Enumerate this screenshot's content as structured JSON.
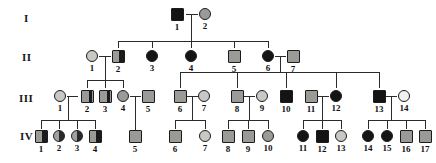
{
  "figure": {
    "background_color": "#ffffff",
    "line_color": "#2b2b2b"
  },
  "legend_colors": {
    "affected_black": "#141414",
    "carrier_gray": "#9a9a96",
    "light_gray": "#c9c8c4",
    "unaffected_clear": "#f2f1ee"
  },
  "generation_labels": [
    {
      "id": "gen-I",
      "text": "I",
      "x": 24,
      "y": 12
    },
    {
      "id": "gen-II",
      "text": "II",
      "x": 22,
      "y": 51
    },
    {
      "id": "gen-III",
      "text": "III",
      "x": 19,
      "y": 92
    },
    {
      "id": "gen-IV",
      "text": "IV",
      "x": 20,
      "y": 130
    }
  ],
  "individuals": [
    {
      "gen": "I",
      "num": "1",
      "sex": "male",
      "fill": "black",
      "cx": 177,
      "cy": 14
    },
    {
      "gen": "I",
      "num": "2",
      "sex": "female",
      "fill": "gray",
      "cx": 205,
      "cy": 14
    },
    {
      "gen": "II",
      "num": "1",
      "sex": "female",
      "fill": "lgray",
      "cx": 92,
      "cy": 56
    },
    {
      "gen": "II",
      "num": "2",
      "sex": "male",
      "fill": "halfright",
      "cx": 118,
      "cy": 56
    },
    {
      "gen": "II",
      "num": "3",
      "sex": "female",
      "fill": "black",
      "cx": 152,
      "cy": 56
    },
    {
      "gen": "II",
      "num": "4",
      "sex": "female",
      "fill": "black",
      "cx": 191,
      "cy": 56
    },
    {
      "gen": "II",
      "num": "5",
      "sex": "male",
      "fill": "gray",
      "cx": 234,
      "cy": 56
    },
    {
      "gen": "II",
      "num": "6",
      "sex": "female",
      "fill": "black",
      "cx": 268,
      "cy": 56
    },
    {
      "gen": "II",
      "num": "7",
      "sex": "male",
      "fill": "gray",
      "cx": 293,
      "cy": 56
    },
    {
      "gen": "III",
      "num": "1",
      "sex": "female",
      "fill": "lgray",
      "cx": 60,
      "cy": 96
    },
    {
      "gen": "III",
      "num": "2",
      "sex": "male",
      "fill": "bandright",
      "cx": 87,
      "cy": 96
    },
    {
      "gen": "III",
      "num": "3",
      "sex": "male",
      "fill": "bandright",
      "cx": 105,
      "cy": 96
    },
    {
      "gen": "III",
      "num": "4",
      "sex": "female",
      "fill": "gray",
      "cx": 123,
      "cy": 96
    },
    {
      "gen": "III",
      "num": "5",
      "sex": "male",
      "fill": "gray",
      "cx": 148,
      "cy": 96
    },
    {
      "gen": "III",
      "num": "6",
      "sex": "male",
      "fill": "gray",
      "cx": 180,
      "cy": 96
    },
    {
      "gen": "III",
      "num": "7",
      "sex": "female",
      "fill": "lgray",
      "cx": 204,
      "cy": 96
    },
    {
      "gen": "III",
      "num": "8",
      "sex": "male",
      "fill": "gray",
      "cx": 237,
      "cy": 96
    },
    {
      "gen": "III",
      "num": "9",
      "sex": "female",
      "fill": "lgray",
      "cx": 262,
      "cy": 96
    },
    {
      "gen": "III",
      "num": "10",
      "sex": "male",
      "fill": "black",
      "cx": 286,
      "cy": 96
    },
    {
      "gen": "III",
      "num": "11",
      "sex": "male",
      "fill": "gray",
      "cx": 311,
      "cy": 96
    },
    {
      "gen": "III",
      "num": "12",
      "sex": "female",
      "fill": "black",
      "cx": 336,
      "cy": 96
    },
    {
      "gen": "III",
      "num": "13",
      "sex": "male",
      "fill": "black",
      "cx": 379,
      "cy": 96
    },
    {
      "gen": "III",
      "num": "14",
      "sex": "female",
      "fill": "clear",
      "cx": 404,
      "cy": 96
    },
    {
      "gen": "IV",
      "num": "1",
      "sex": "male",
      "fill": "halfright",
      "cx": 41,
      "cy": 136
    },
    {
      "gen": "IV",
      "num": "2",
      "sex": "female",
      "fill": "halfright-c",
      "cx": 59,
      "cy": 136
    },
    {
      "gen": "IV",
      "num": "3",
      "sex": "female",
      "fill": "halfright-c",
      "cx": 77,
      "cy": 136
    },
    {
      "gen": "IV",
      "num": "4",
      "sex": "male",
      "fill": "halfright",
      "cx": 95,
      "cy": 136
    },
    {
      "gen": "IV",
      "num": "5",
      "sex": "male",
      "fill": "gray",
      "cx": 135,
      "cy": 136
    },
    {
      "gen": "IV",
      "num": "6",
      "sex": "male",
      "fill": "gray",
      "cx": 175,
      "cy": 136
    },
    {
      "gen": "IV",
      "num": "7",
      "sex": "female",
      "fill": "lgray",
      "cx": 205,
      "cy": 136
    },
    {
      "gen": "IV",
      "num": "8",
      "sex": "male",
      "fill": "gray",
      "cx": 228,
      "cy": 136
    },
    {
      "gen": "IV",
      "num": "9",
      "sex": "male",
      "fill": "gray",
      "cx": 248,
      "cy": 136
    },
    {
      "gen": "IV",
      "num": "10",
      "sex": "female",
      "fill": "gray",
      "cx": 268,
      "cy": 136
    },
    {
      "gen": "IV",
      "num": "11",
      "sex": "female",
      "fill": "black",
      "cx": 303,
      "cy": 136
    },
    {
      "gen": "IV",
      "num": "12",
      "sex": "male",
      "fill": "black",
      "cx": 322,
      "cy": 136
    },
    {
      "gen": "IV",
      "num": "13",
      "sex": "female",
      "fill": "lgray",
      "cx": 341,
      "cy": 136
    },
    {
      "gen": "IV",
      "num": "14",
      "sex": "female",
      "fill": "black",
      "cx": 368,
      "cy": 136
    },
    {
      "gen": "IV",
      "num": "15",
      "sex": "female",
      "fill": "black",
      "cx": 387,
      "cy": 136
    },
    {
      "gen": "IV",
      "num": "16",
      "sex": "male",
      "fill": "gray",
      "cx": 406,
      "cy": 136
    },
    {
      "gen": "IV",
      "num": "17",
      "sex": "male",
      "fill": "gray",
      "cx": 425,
      "cy": 136
    }
  ],
  "connectors": [
    {
      "name": "mating-I1-I2",
      "orient": "h",
      "x": 186,
      "y": 14,
      "len": 12
    },
    {
      "name": "descent-I-to-II",
      "orient": "v",
      "x": 191,
      "y": 14,
      "len": 27
    },
    {
      "name": "sibship-II-bar",
      "orient": "h",
      "x": 118,
      "y": 41,
      "len": 150
    },
    {
      "name": "drop-II-2",
      "orient": "v",
      "x": 118,
      "y": 41,
      "len": 7
    },
    {
      "name": "drop-II-3",
      "orient": "v",
      "x": 152,
      "y": 41,
      "len": 7
    },
    {
      "name": "drop-II-4",
      "orient": "v",
      "x": 191,
      "y": 41,
      "len": 7
    },
    {
      "name": "drop-II-5",
      "orient": "v",
      "x": 234,
      "y": 41,
      "len": 7
    },
    {
      "name": "drop-II-6",
      "orient": "v",
      "x": 268,
      "y": 41,
      "len": 7
    },
    {
      "name": "mating-II1-II2",
      "orient": "h",
      "x": 99,
      "y": 56,
      "len": 12
    },
    {
      "name": "descent-II1x2",
      "orient": "v",
      "x": 105,
      "y": 56,
      "len": 24
    },
    {
      "name": "sibship-III-A",
      "orient": "h",
      "x": 87,
      "y": 80,
      "len": 36
    },
    {
      "name": "drop-III-2",
      "orient": "v",
      "x": 87,
      "y": 80,
      "len": 8
    },
    {
      "name": "drop-III-3",
      "orient": "v",
      "x": 105,
      "y": 80,
      "len": 8
    },
    {
      "name": "drop-III-4",
      "orient": "v",
      "x": 123,
      "y": 80,
      "len": 8
    },
    {
      "name": "mating-II6-II7",
      "orient": "h",
      "x": 275,
      "y": 56,
      "len": 11
    },
    {
      "name": "descent-II6x7",
      "orient": "v",
      "x": 280,
      "y": 56,
      "len": 16
    },
    {
      "name": "sibship-III-B",
      "orient": "h",
      "x": 180,
      "y": 72,
      "len": 199
    },
    {
      "name": "drop-III-6",
      "orient": "v",
      "x": 180,
      "y": 72,
      "len": 16
    },
    {
      "name": "drop-III-8",
      "orient": "v",
      "x": 237,
      "y": 72,
      "len": 16
    },
    {
      "name": "drop-III-10",
      "orient": "v",
      "x": 286,
      "y": 72,
      "len": 16
    },
    {
      "name": "drop-III-12",
      "orient": "v",
      "x": 336,
      "y": 72,
      "len": 16
    },
    {
      "name": "drop-III-13",
      "orient": "v",
      "x": 379,
      "y": 72,
      "len": 16
    },
    {
      "name": "mating-III4-III5",
      "orient": "h",
      "x": 130,
      "y": 96,
      "len": 11
    },
    {
      "name": "descent-III4x5",
      "orient": "v",
      "x": 135,
      "y": 96,
      "len": 34
    },
    {
      "name": "mating-III6-III7",
      "orient": "h",
      "x": 187,
      "y": 96,
      "len": 11
    },
    {
      "name": "descent-III6x7",
      "orient": "v",
      "x": 192,
      "y": 96,
      "len": 24
    },
    {
      "name": "sibship-IV-C",
      "orient": "h",
      "x": 175,
      "y": 120,
      "len": 30
    },
    {
      "name": "drop-IV-6",
      "orient": "v",
      "x": 175,
      "y": 120,
      "len": 9
    },
    {
      "name": "drop-IV-7",
      "orient": "v",
      "x": 205,
      "y": 120,
      "len": 9
    },
    {
      "name": "mating-III8-III9",
      "orient": "h",
      "x": 244,
      "y": 96,
      "len": 11
    },
    {
      "name": "descent-III8x9",
      "orient": "v",
      "x": 249,
      "y": 96,
      "len": 24
    },
    {
      "name": "sibship-IV-D",
      "orient": "h",
      "x": 228,
      "y": 120,
      "len": 40
    },
    {
      "name": "drop-IV-8",
      "orient": "v",
      "x": 228,
      "y": 120,
      "len": 9
    },
    {
      "name": "drop-IV-9",
      "orient": "v",
      "x": 248,
      "y": 120,
      "len": 9
    },
    {
      "name": "drop-IV-10",
      "orient": "v",
      "x": 268,
      "y": 120,
      "len": 9
    },
    {
      "name": "mating-III11-III12",
      "orient": "h",
      "x": 318,
      "y": 96,
      "len": 11
    },
    {
      "name": "descent-III11x12",
      "orient": "v",
      "x": 322,
      "y": 96,
      "len": 24
    },
    {
      "name": "sibship-IV-E",
      "orient": "h",
      "x": 303,
      "y": 120,
      "len": 38
    },
    {
      "name": "drop-IV-11",
      "orient": "v",
      "x": 303,
      "y": 120,
      "len": 9
    },
    {
      "name": "drop-IV-12",
      "orient": "v",
      "x": 322,
      "y": 120,
      "len": 9
    },
    {
      "name": "drop-IV-13",
      "orient": "v",
      "x": 341,
      "y": 120,
      "len": 9
    },
    {
      "name": "mating-III13-III14",
      "orient": "h",
      "x": 386,
      "y": 96,
      "len": 11
    },
    {
      "name": "descent-III13x14",
      "orient": "v",
      "x": 391,
      "y": 96,
      "len": 24
    },
    {
      "name": "sibship-IV-F",
      "orient": "h",
      "x": 368,
      "y": 120,
      "len": 57
    },
    {
      "name": "drop-IV-14",
      "orient": "v",
      "x": 368,
      "y": 120,
      "len": 9
    },
    {
      "name": "drop-IV-15",
      "orient": "v",
      "x": 387,
      "y": 120,
      "len": 9
    },
    {
      "name": "drop-IV-16",
      "orient": "v",
      "x": 406,
      "y": 120,
      "len": 9
    },
    {
      "name": "drop-IV-17",
      "orient": "v",
      "x": 425,
      "y": 120,
      "len": 9
    },
    {
      "name": "mating-III1-III2",
      "orient": "h",
      "x": 67,
      "y": 96,
      "len": 11
    },
    {
      "name": "descent-III1x2",
      "orient": "v",
      "x": 68,
      "y": 96,
      "len": 24
    },
    {
      "name": "sibship-IV-A",
      "orient": "h",
      "x": 41,
      "y": 120,
      "len": 54
    },
    {
      "name": "drop-IV-1",
      "orient": "v",
      "x": 41,
      "y": 120,
      "len": 9
    },
    {
      "name": "drop-IV-2",
      "orient": "v",
      "x": 59,
      "y": 120,
      "len": 9
    },
    {
      "name": "drop-IV-3",
      "orient": "v",
      "x": 77,
      "y": 120,
      "len": 9
    },
    {
      "name": "drop-IV-4",
      "orient": "v",
      "x": 95,
      "y": 120,
      "len": 9
    }
  ]
}
